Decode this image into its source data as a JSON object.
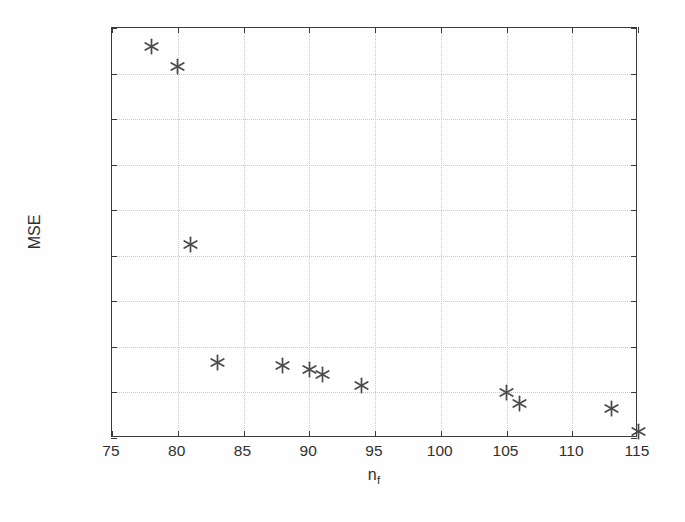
{
  "chart_data": {
    "type": "scatter",
    "title": "",
    "xlabel": "n_f",
    "xlabel_base": "n",
    "xlabel_sub": "f",
    "ylabel": "MSE",
    "xlim": [
      75,
      115
    ],
    "ylim": [
      0.002,
      0.02
    ],
    "grid": true,
    "legend": null,
    "marker": "asterisk",
    "marker_color": "#4a4a4a",
    "xticks": [
      75,
      80,
      85,
      90,
      95,
      100,
      105,
      110,
      115
    ],
    "xticklabels": [
      "75",
      "80",
      "85",
      "90",
      "95",
      "100",
      "105",
      "110",
      "115"
    ],
    "yticks": [
      0.002,
      0.004,
      0.006,
      0.008,
      0.01,
      0.012,
      0.014,
      0.016,
      0.018,
      0.02
    ],
    "yticklabels": [
      "0.002",
      "0.004",
      "0.006",
      "0.008",
      "0.01",
      "0.012",
      "0.014",
      "0.016",
      "0.018",
      "0.02"
    ],
    "x": [
      78,
      80,
      81,
      83,
      88,
      90,
      91,
      94,
      105,
      106,
      113,
      115
    ],
    "y": [
      0.0192,
      0.0183,
      0.0105,
      0.0053,
      0.0052,
      0.005,
      0.0048,
      0.0043,
      0.004,
      0.0035,
      0.0033,
      0.0023
    ],
    "points": [
      {
        "x": 78,
        "y": 0.0192
      },
      {
        "x": 80,
        "y": 0.0183
      },
      {
        "x": 81,
        "y": 0.0105
      },
      {
        "x": 83,
        "y": 0.0053
      },
      {
        "x": 88,
        "y": 0.0052
      },
      {
        "x": 90,
        "y": 0.005
      },
      {
        "x": 91,
        "y": 0.0048
      },
      {
        "x": 94,
        "y": 0.0043
      },
      {
        "x": 105,
        "y": 0.004
      },
      {
        "x": 106,
        "y": 0.0035
      },
      {
        "x": 113,
        "y": 0.0033
      },
      {
        "x": 115,
        "y": 0.0023
      }
    ]
  },
  "style": {
    "axis_color": "#3a3a3a",
    "grid_color": "#c9c9c9",
    "text_color": "#303030",
    "background": "#fefefe"
  }
}
